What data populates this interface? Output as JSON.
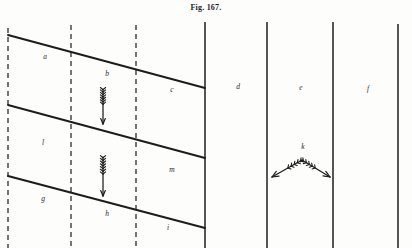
{
  "figure": {
    "caption": "Fig. 167.",
    "width": 412,
    "height": 248,
    "background_color": "#fdfdfc",
    "ink_color": "#1c1c1c"
  },
  "chart_data": {
    "type": "diagram",
    "title": "Fig. 167.",
    "xlabel": "",
    "ylabel": "",
    "grid": false,
    "legend_position": "none",
    "vertical_lines": [
      {
        "id": "v1",
        "x": 8,
        "y_top": 28,
        "y_bottom": 248,
        "style": "dashed"
      },
      {
        "id": "v2",
        "x": 71,
        "y_top": 25,
        "y_bottom": 248,
        "style": "dashed"
      },
      {
        "id": "v3",
        "x": 136,
        "y_top": 25,
        "y_bottom": 248,
        "style": "dashed"
      },
      {
        "id": "v4",
        "x": 205,
        "y_top": 22,
        "y_bottom": 248,
        "style": "solid"
      },
      {
        "id": "v5",
        "x": 267,
        "y_top": 22,
        "y_bottom": 248,
        "style": "solid"
      },
      {
        "id": "v6",
        "x": 333,
        "y_top": 22,
        "y_bottom": 248,
        "style": "solid"
      },
      {
        "id": "v7",
        "x": 398,
        "y_top": 24,
        "y_bottom": 248,
        "style": "solid"
      }
    ],
    "sloping_lines": [
      {
        "id": "s1",
        "x1": 8,
        "y1": 35,
        "x2": 205,
        "y2": 88,
        "style": "solid"
      },
      {
        "id": "s2",
        "x1": 8,
        "y1": 105,
        "x2": 205,
        "y2": 158,
        "style": "solid"
      },
      {
        "id": "s3",
        "x1": 8,
        "y1": 176,
        "x2": 205,
        "y2": 228,
        "style": "solid"
      }
    ],
    "arrows": [
      {
        "id": "arrow-b",
        "kind": "fletched-down",
        "x": 103,
        "y_tail": 89,
        "y_head": 124,
        "direction": "down"
      },
      {
        "id": "arrow-h",
        "kind": "fletched-down",
        "x": 103,
        "y_tail": 157,
        "y_head": 196,
        "direction": "down"
      },
      {
        "id": "arrow-k-left",
        "kind": "fletched-diagonal",
        "x1": 302,
        "y1": 160,
        "x2": 272,
        "y2": 177,
        "direction": "down-left"
      },
      {
        "id": "arrow-k-right",
        "kind": "fletched-diagonal",
        "x1": 302,
        "y1": 160,
        "x2": 330,
        "y2": 177,
        "direction": "down-right"
      }
    ],
    "labels": [
      {
        "id": "label-a",
        "text": "a",
        "x": 45,
        "y": 57
      },
      {
        "id": "label-b",
        "text": "b",
        "x": 107,
        "y": 74
      },
      {
        "id": "label-c",
        "text": "c",
        "x": 172,
        "y": 90
      },
      {
        "id": "label-d",
        "text": "d",
        "x": 238,
        "y": 87
      },
      {
        "id": "label-e",
        "text": "e",
        "x": 301,
        "y": 88
      },
      {
        "id": "label-f",
        "text": "f",
        "x": 368,
        "y": 89
      },
      {
        "id": "label-l",
        "text": "l",
        "x": 43,
        "y": 143
      },
      {
        "id": "label-m",
        "text": "m",
        "x": 172,
        "y": 170
      },
      {
        "id": "label-k",
        "text": "k",
        "x": 303,
        "y": 147
      },
      {
        "id": "label-g",
        "text": "g",
        "x": 43,
        "y": 199
      },
      {
        "id": "label-h",
        "text": "h",
        "x": 107,
        "y": 214
      },
      {
        "id": "label-i",
        "text": "i",
        "x": 168,
        "y": 228
      }
    ]
  }
}
